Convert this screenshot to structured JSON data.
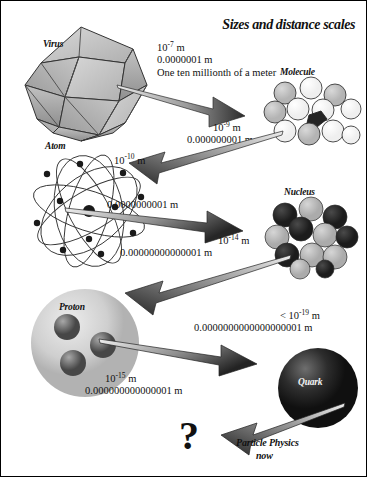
{
  "diagram": {
    "title": "Sizes and distance scales",
    "footer_note": {
      "line1": "Particle Physics",
      "line2": "now"
    },
    "unknown_marker": "?"
  },
  "objects": [
    {
      "id": "virus",
      "label": "Virus"
    },
    {
      "id": "molecule",
      "label": "Molecule"
    },
    {
      "id": "atom",
      "label": "Atom"
    },
    {
      "id": "nucleus",
      "label": "Nucleus"
    },
    {
      "id": "proton",
      "label": "Proton"
    },
    {
      "id": "quark",
      "label": "Quark"
    }
  ],
  "scales": [
    {
      "for": "virus",
      "exponent_base": "10",
      "exponent": "-7",
      "unit": "m",
      "decimal": "0.0000001 m",
      "words": "One ten millionth of a meter"
    },
    {
      "for": "molecule",
      "exponent_base": "10",
      "exponent": "-9",
      "unit": "m",
      "decimal": "0.000000001 m"
    },
    {
      "for": "atom",
      "exponent_base": "10",
      "exponent": "-10",
      "unit": "m",
      "decimal": "0.0000000001 m"
    },
    {
      "for": "nucleus",
      "exponent_base": "10",
      "exponent": "-14",
      "unit": "m",
      "decimal": "0.00000000000001 m"
    },
    {
      "for": "proton",
      "exponent_base": "10",
      "exponent": "-15",
      "unit": "m",
      "decimal": "0.000000000000001 m"
    },
    {
      "for": "quark",
      "prefix": "< ",
      "exponent_base": "10",
      "exponent": "-19",
      "unit": "m",
      "decimal": "0.0000000000000000001 m"
    }
  ],
  "colors": {
    "ink": "#111111",
    "arrow_dark": "#2b2b2b",
    "arrow_light": "#e8e8e8",
    "virus_face_light": "#c9c9c9",
    "virus_face_mid": "#a9a9a9",
    "virus_face_dark": "#8d8d8d",
    "molecule_light": "#fbfbfb",
    "molecule_gray": "#c4c4c4",
    "nucleus_dark": "#2a2a2a",
    "nucleus_light": "#bdbdbd",
    "proton_body": "#cfcfcf",
    "quark_sphere": "#1d1d1d",
    "background": "#ffffff"
  }
}
